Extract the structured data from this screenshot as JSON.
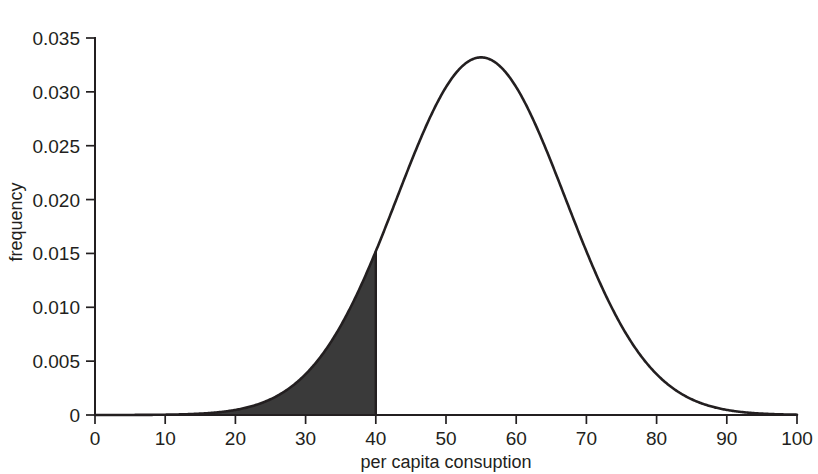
{
  "chart_data": {
    "type": "line",
    "title": "",
    "subtitle": "",
    "xlabel": "per capita consuption",
    "ylabel": "frequency",
    "xlim": [
      0,
      100
    ],
    "ylim": [
      0,
      0.035
    ],
    "grid": false,
    "legend": null,
    "x_ticks": [
      "0",
      "10",
      "20",
      "30",
      "40",
      "50",
      "60",
      "70",
      "80",
      "90",
      "100"
    ],
    "x_tick_values": [
      0,
      10,
      20,
      30,
      40,
      50,
      60,
      70,
      80,
      90,
      100
    ],
    "y_ticks": [
      "0",
      "0.005",
      "0.010",
      "0.015",
      "0.020",
      "0.025",
      "0.030",
      "0.035"
    ],
    "y_tick_values": [
      0,
      0.005,
      0.01,
      0.015,
      0.02,
      0.025,
      0.03,
      0.035
    ],
    "curve": {
      "name": "normal density",
      "distribution": "normal",
      "mean": 55,
      "sd": 12,
      "peak_x": 55,
      "peak_y": 0.0332,
      "color": "#231f20",
      "x": [
        0,
        5,
        10,
        15,
        20,
        25,
        30,
        35,
        40,
        45,
        50,
        55,
        60,
        65,
        70,
        75,
        80,
        85,
        90,
        95,
        100
      ],
      "y": [
        0.0,
        0.0,
        0.0,
        0.0001,
        0.0004,
        0.0016,
        0.0045,
        0.0097,
        0.0153,
        0.0258,
        0.0314,
        0.0332,
        0.0314,
        0.0258,
        0.0153,
        0.0097,
        0.0045,
        0.0016,
        0.0004,
        0.0001,
        0.0
      ]
    },
    "shaded_region": {
      "label": "left tail shaded",
      "x_from": 0,
      "x_to": 40,
      "fill_color": "#3a3a3a",
      "edge_height_at_cut": 0.0148
    }
  },
  "axes": {
    "x_axis_name": "per capita consuption",
    "y_axis_name": "frequency"
  }
}
